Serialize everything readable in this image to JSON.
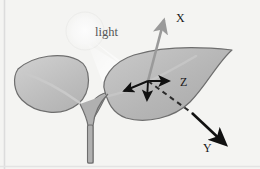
{
  "figure": {
    "background_color": "#f4f4f2",
    "labels": {
      "light": "light",
      "axis_x": "X",
      "axis_y": "Y",
      "axis_z": "Z"
    },
    "colors": {
      "leaf_fill": "#b9b9b9",
      "leaf_fill_light": "#c9c9c9",
      "leaf_outline": "#6b6b6b",
      "stem": "#a8a8a8",
      "stem_outline": "#6b6b6b",
      "axis_x_arrow": "#9a9a9a",
      "axis_y_arrow": "#111111",
      "axis_z_arrow": "#111111",
      "normal_arrow": "#111111",
      "dashed_line": "#2b2b2b",
      "light_glow": "#fdfdfd",
      "label_text": "#1a1a1a",
      "light_label_text": "#555555",
      "edge_line": "#d8d8d8"
    },
    "elements": {
      "light_source": "light-glow-circle",
      "light_beam": "light-beam-cone",
      "left_leaf": "left-leaf-shape",
      "right_leaf": "right-leaf-shape",
      "stem": "plant-stem",
      "origin": "axes-origin-point"
    },
    "geometry": {
      "origin_x": 148,
      "origin_y": 81,
      "x_axis_tip": [
        163,
        16
      ],
      "z_axis_tip": [
        172,
        81
      ],
      "y_axis_tip": [
        228,
        148
      ],
      "light_glow_center": [
        85,
        31
      ],
      "light_glow_radius": 19
    }
  }
}
